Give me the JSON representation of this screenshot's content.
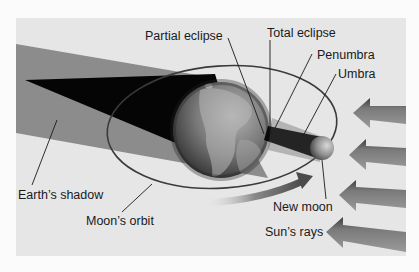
{
  "diagram": {
    "type": "solar-eclipse-geometry",
    "labels": {
      "partial_eclipse": "Partial eclipse",
      "total_eclipse": "Total eclipse",
      "penumbra": "Penumbra",
      "umbra": "Umbra",
      "earths_shadow": "Earth’s shadow",
      "moons_orbit": "Moon’s orbit",
      "new_moon": "New moon",
      "suns_rays": "Sun’s rays"
    },
    "objects": {
      "earth": "Earth globe",
      "moon": "New moon",
      "sun_rays_count": 4,
      "orbit": "Moon's orbit ellipse",
      "orbit_direction": "counterclockwise arrow"
    },
    "colors": {
      "panel_bg": "#e6e6e6",
      "page_bg": "#fbfbfb",
      "penumbra": "#8c8c8c",
      "umbra": "#050505",
      "earth": "#6b6b6b",
      "orbit_line": "#3a3a3a",
      "arrow": "#6e6e6e"
    }
  }
}
